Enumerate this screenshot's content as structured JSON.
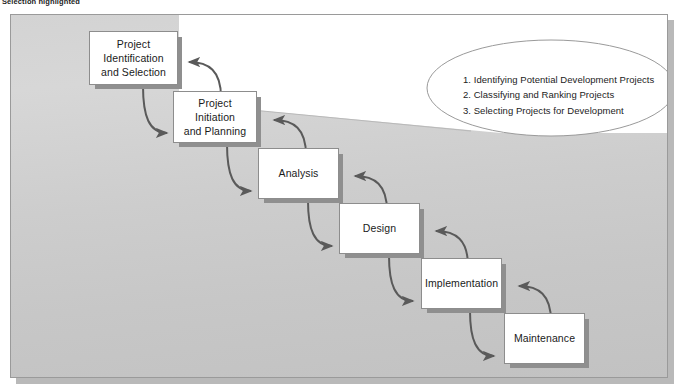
{
  "caption": {
    "text": "Selection highlighted"
  },
  "diagram": {
    "colors": {
      "panel_light": "#d5d5d5",
      "panel_dark": "#c2c2c2",
      "node_fill": "#ffffff",
      "node_border": "#8d8d8d",
      "node_shadow": "#8f8f8f",
      "arrow": "#5a5a5a",
      "callout_fill": "#ffffff",
      "callout_border": "#9a9a9a",
      "text": "#1a1a1a"
    },
    "nodes": [
      {
        "id": "identification",
        "label": "Project\nIdentification\nand Selection",
        "lines": [
          "Project",
          "Identification",
          "and Selection"
        ]
      },
      {
        "id": "initiation",
        "label": "Project\nInitiation\nand Planning",
        "lines": [
          "Project",
          "Initiation",
          "and Planning"
        ]
      },
      {
        "id": "analysis",
        "label": "Analysis",
        "lines": [
          "Analysis"
        ]
      },
      {
        "id": "design",
        "label": "Design",
        "lines": [
          "Design"
        ]
      },
      {
        "id": "implementation",
        "label": "Implementation",
        "lines": [
          "Implementation"
        ]
      },
      {
        "id": "maintenance",
        "label": "Maintenance",
        "lines": [
          "Maintenance"
        ]
      }
    ],
    "callout": {
      "target": "identification",
      "items": [
        "1. Identifying Potential Development Projects",
        "2. Classifying and Ranking Projects",
        "3. Selecting Projects for Development"
      ]
    },
    "connections": [
      {
        "from": "identification",
        "to": "initiation",
        "direction": "forward"
      },
      {
        "from": "initiation",
        "to": "identification",
        "direction": "backward"
      },
      {
        "from": "initiation",
        "to": "analysis",
        "direction": "forward"
      },
      {
        "from": "analysis",
        "to": "initiation",
        "direction": "backward"
      },
      {
        "from": "analysis",
        "to": "design",
        "direction": "forward"
      },
      {
        "from": "design",
        "to": "analysis",
        "direction": "backward"
      },
      {
        "from": "design",
        "to": "implementation",
        "direction": "forward"
      },
      {
        "from": "implementation",
        "to": "design",
        "direction": "backward"
      },
      {
        "from": "implementation",
        "to": "maintenance",
        "direction": "forward"
      },
      {
        "from": "maintenance",
        "to": "implementation",
        "direction": "backward"
      }
    ]
  }
}
